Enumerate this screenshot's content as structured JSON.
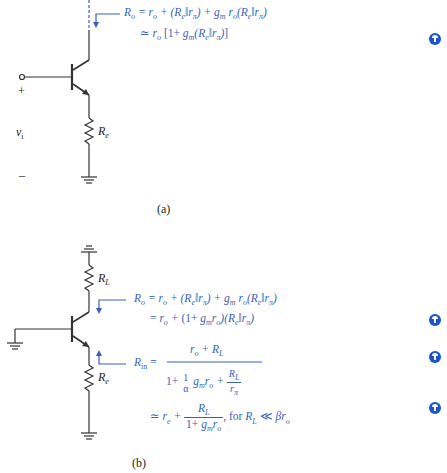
{
  "figure_a": {
    "caption": "(a)",
    "labels": {
      "resistor": "R",
      "resistor_sub": "e",
      "input_voltage": "v",
      "input_voltage_sub": "i",
      "plus": "+",
      "minus": "–"
    },
    "equations": {
      "line1": "R_o = r_o + (R_e‖r_π) + g_m r_o(R_e‖r_π)",
      "line2": "≃ r_o [1+ g_m(R_e‖r_π)]"
    }
  },
  "figure_b": {
    "caption": "(b)",
    "labels": {
      "load_resistor": "R",
      "load_resistor_sub": "L",
      "emitter_resistor": "R",
      "emitter_resistor_sub": "e"
    },
    "equations": {
      "ro_line1": "R_o = r_o + (R_e‖r_π) + g_m r_o(R_e‖r_π)",
      "ro_line2": "= r_o + (1+ g_m r_o)(R_e‖r_π)",
      "rin_numerator": "r_o + R_L",
      "rin_denominator": "1+ (1/α) g_m r_o + R_L/r_π",
      "rin_approx": "≃ r_e + R_L/(1+ g_m r_o), for R_L ≪ βr_o"
    }
  },
  "colors": {
    "equation": "#3a5fb8",
    "note_icon": "#1a56c9",
    "wire": "#333333"
  },
  "note_icons": [
    "note-icon-a",
    "note-icon-b-ro",
    "note-icon-b-rin",
    "note-icon-b-approx"
  ]
}
